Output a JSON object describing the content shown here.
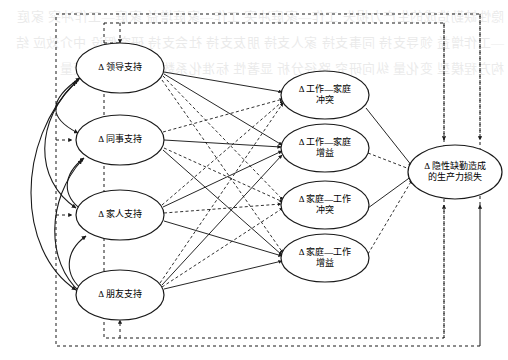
{
  "figure": {
    "type": "path-diagram",
    "background_watermark": "隐性缺勤造成的生产力损失 工作—家庭冲突 工作—家庭增益 家庭—工作冲突 家庭—工作增益 领导支持 同事支持 家人支持 朋友支持 社会支持 研究假设 中介效应 结构方程模型 变化量 纵向研究 路径分析 显著性 标准化系数 潜变量 控制变量"
  },
  "colors": {
    "stroke": "#1a1a1a",
    "node_fill": "#ffffff",
    "frame": "#1a1a1a",
    "text": "#000000"
  },
  "nodes": {
    "support": [
      {
        "id": "leader-support",
        "label": "Δ 领导支持",
        "lines": [
          "Δ 领导支持"
        ],
        "cx": 120,
        "cy": 68,
        "rx": 44,
        "ry": 25
      },
      {
        "id": "coworker-support",
        "label": "Δ 同事支持",
        "lines": [
          "Δ 同事支持"
        ],
        "cx": 120,
        "cy": 140,
        "rx": 44,
        "ry": 25
      },
      {
        "id": "family-support",
        "label": "Δ 家人支持",
        "lines": [
          "Δ 家人支持"
        ],
        "cx": 120,
        "cy": 215,
        "rx": 44,
        "ry": 25
      },
      {
        "id": "friend-support",
        "label": "Δ 朋友支持",
        "lines": [
          "Δ 朋友支持"
        ],
        "cx": 120,
        "cy": 295,
        "rx": 44,
        "ry": 25
      }
    ],
    "mediators": [
      {
        "id": "wfc",
        "label": "Δ 工作—家庭冲突",
        "lines": [
          "Δ 工作—家庭",
          "冲突"
        ],
        "cx": 325,
        "cy": 95,
        "rx": 44,
        "ry": 24
      },
      {
        "id": "wfe",
        "label": "Δ 工作—家庭增益",
        "lines": [
          "Δ 工作—家庭",
          "增益"
        ],
        "cx": 325,
        "cy": 148,
        "rx": 44,
        "ry": 24
      },
      {
        "id": "fwc",
        "label": "Δ 家庭—工作冲突",
        "lines": [
          "Δ 家庭—工作",
          "冲突"
        ],
        "cx": 325,
        "cy": 205,
        "rx": 44,
        "ry": 24
      },
      {
        "id": "fwe",
        "label": "Δ 家庭—工作增益",
        "lines": [
          "Δ 家庭—工作",
          "增益"
        ],
        "cx": 325,
        "cy": 258,
        "rx": 44,
        "ry": 24
      }
    ],
    "outcome": {
      "id": "presenteeism-productivity-loss",
      "label": "Δ 隐性缺勤造成的生产力损失",
      "lines": [
        "Δ 隐性缺勤造成",
        "的生产力损失"
      ],
      "cx": 455,
      "cy": 172,
      "rx": 47,
      "ry": 27
    }
  },
  "frames": [
    {
      "id": "outer-dashed-frame",
      "x": 56,
      "y": 14,
      "w": 424,
      "h": 332
    },
    {
      "id": "inner-dashed-frame",
      "x": 104,
      "y": 23,
      "w": 340,
      "h": 315
    }
  ],
  "edges": {
    "solid_note": "solid arrow = hypothesized direct effect",
    "dashed_note": "dashed arrow = hypothesized indirect / control path",
    "support_to_mediator": [
      {
        "from": "leader-support",
        "to": "wfc",
        "style": "solid"
      },
      {
        "from": "leader-support",
        "to": "wfe",
        "style": "solid"
      },
      {
        "from": "leader-support",
        "to": "fwc",
        "style": "dashed"
      },
      {
        "from": "leader-support",
        "to": "fwe",
        "style": "dashed"
      },
      {
        "from": "coworker-support",
        "to": "wfc",
        "style": "dashed"
      },
      {
        "from": "coworker-support",
        "to": "wfe",
        "style": "solid"
      },
      {
        "from": "coworker-support",
        "to": "fwc",
        "style": "dashed"
      },
      {
        "from": "coworker-support",
        "to": "fwe",
        "style": "solid"
      },
      {
        "from": "family-support",
        "to": "wfc",
        "style": "dashed"
      },
      {
        "from": "family-support",
        "to": "wfe",
        "style": "solid"
      },
      {
        "from": "family-support",
        "to": "fwc",
        "style": "dashed"
      },
      {
        "from": "family-support",
        "to": "fwe",
        "style": "solid"
      },
      {
        "from": "friend-support",
        "to": "wfc",
        "style": "dashed"
      },
      {
        "from": "friend-support",
        "to": "wfe",
        "style": "solid"
      },
      {
        "from": "friend-support",
        "to": "fwc",
        "style": "dashed"
      },
      {
        "from": "friend-support",
        "to": "fwe",
        "style": "solid"
      }
    ],
    "mediator_to_outcome": [
      {
        "from": "wfc",
        "to": "presenteeism-productivity-loss",
        "style": "solid"
      },
      {
        "from": "wfe",
        "to": "presenteeism-productivity-loss",
        "style": "dashed"
      },
      {
        "from": "fwc",
        "to": "presenteeism-productivity-loss",
        "style": "solid"
      },
      {
        "from": "fwe",
        "to": "presenteeism-productivity-loss",
        "style": "dashed"
      }
    ],
    "correlations": [
      {
        "a": "leader-support",
        "b": "coworker-support",
        "style": "curved-double"
      },
      {
        "a": "leader-support",
        "b": "family-support",
        "style": "curved-double"
      },
      {
        "a": "leader-support",
        "b": "friend-support",
        "style": "curved-double"
      },
      {
        "a": "coworker-support",
        "b": "family-support",
        "style": "curved-double"
      },
      {
        "a": "coworker-support",
        "b": "friend-support",
        "style": "curved-double"
      },
      {
        "a": "family-support",
        "b": "friend-support",
        "style": "curved-double"
      }
    ],
    "frame_paths": [
      {
        "id": "outer-frame-to-outcome-top",
        "style": "dashed"
      },
      {
        "id": "inner-frame-to-outcome-top",
        "style": "dashed"
      },
      {
        "id": "outer-frame-to-outcome-bottom",
        "style": "dashed"
      },
      {
        "id": "inner-frame-to-outcome-bottom",
        "style": "dashed"
      }
    ]
  }
}
